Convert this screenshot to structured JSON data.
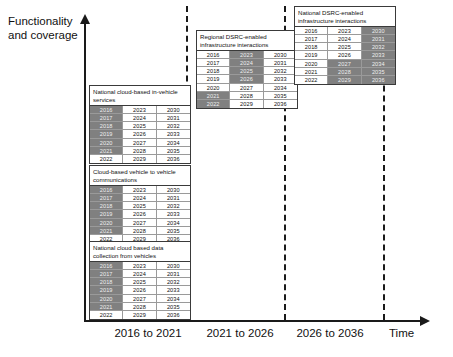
{
  "axes": {
    "y_label": "Functionality and coverage",
    "x_label": "Time",
    "periods": [
      {
        "label": "2016 to 2021",
        "left": 98,
        "width": 100
      },
      {
        "label": "2021 to 2026",
        "left": 190,
        "width": 100
      },
      {
        "label": "2026 to 2036",
        "left": 280,
        "width": 100
      }
    ]
  },
  "colors": {
    "shaded_cell": "#808080",
    "plain_cell": "#ffffff",
    "line": "#1a1a1a",
    "grid": "#9a9a9a"
  },
  "dividers": [
    186,
    284,
    383
  ],
  "chart_data": {
    "type": "table",
    "xlabel": "Time",
    "ylabel": "Functionality and coverage",
    "x_tick_labels": [
      "2016 to 2021",
      "2021 to 2026",
      "2026 to 2036"
    ],
    "legend": [],
    "grid": false,
    "tables": [
      {
        "name": "national-cloud-based-in-vehicle-services",
        "title": "National cloud-based in-vehicle services",
        "left": 89,
        "top": 85,
        "width": 102,
        "columns": [
          [
            "2016",
            "2017",
            "2018",
            "2019",
            "2020",
            "2021",
            "2022"
          ],
          [
            "2023",
            "2024",
            "2025",
            "2026",
            "2027",
            "2028",
            "2029"
          ],
          [
            "2030",
            "2031",
            "2032",
            "2033",
            "2034",
            "2035",
            "2036"
          ]
        ],
        "shaded": [
          [
            true,
            true,
            true,
            true,
            true,
            true,
            false
          ],
          [
            false,
            false,
            false,
            false,
            false,
            false,
            false
          ],
          [
            false,
            false,
            false,
            false,
            false,
            false,
            false
          ]
        ]
      },
      {
        "name": "cloud-based-vehicle-to-vehicle-communications",
        "title": "Cloud-based vehicle to vehicle communications",
        "left": 89,
        "top": 165,
        "width": 102,
        "columns": [
          [
            "2016",
            "2017",
            "2018",
            "2019",
            "2020",
            "2021",
            "2022"
          ],
          [
            "2023",
            "2024",
            "2025",
            "2026",
            "2027",
            "2028",
            "2029"
          ],
          [
            "2030",
            "2031",
            "2032",
            "2033",
            "2034",
            "2035",
            "2036"
          ]
        ],
        "shaded": [
          [
            true,
            true,
            true,
            true,
            true,
            true,
            false
          ],
          [
            false,
            false,
            false,
            false,
            false,
            false,
            false
          ],
          [
            false,
            false,
            false,
            false,
            false,
            false,
            false
          ]
        ]
      },
      {
        "name": "national-cloud-based-data-collection-from-vehicles",
        "title": "National cloud based data collection from vehicles",
        "left": 89,
        "top": 241,
        "width": 102,
        "columns": [
          [
            "2016",
            "2017",
            "2018",
            "2019",
            "2020",
            "2021",
            "2022"
          ],
          [
            "2023",
            "2024",
            "2025",
            "2026",
            "2027",
            "2028",
            "2029"
          ],
          [
            "2030",
            "2031",
            "2032",
            "2033",
            "2034",
            "2035",
            "2036"
          ]
        ],
        "shaded": [
          [
            true,
            true,
            true,
            true,
            true,
            true,
            false
          ],
          [
            false,
            false,
            false,
            false,
            false,
            false,
            false
          ],
          [
            false,
            false,
            false,
            false,
            false,
            false,
            false
          ]
        ]
      },
      {
        "name": "regional-dsrc-enabled-infrastructure-interactions",
        "title": "Regional DSRC-enabled infrastructure interactions",
        "left": 196,
        "top": 30,
        "width": 102,
        "columns": [
          [
            "2016",
            "2017",
            "2018",
            "2019",
            "2020",
            "2021",
            "2022"
          ],
          [
            "2023",
            "2024",
            "2025",
            "2026",
            "2027",
            "2028",
            "2029"
          ],
          [
            "2030",
            "2031",
            "2032",
            "2033",
            "2034",
            "2035",
            "2036"
          ]
        ],
        "shaded": [
          [
            false,
            false,
            false,
            false,
            false,
            true,
            true
          ],
          [
            true,
            true,
            true,
            true,
            false,
            false,
            false
          ],
          [
            false,
            false,
            false,
            false,
            false,
            false,
            false
          ]
        ]
      },
      {
        "name": "national-dsrc-enabled-infrastructure-interactions",
        "title": "National DSRC-enabled infrastructure interactions",
        "left": 294,
        "top": 6,
        "width": 102,
        "columns": [
          [
            "2016",
            "2017",
            "2018",
            "2019",
            "2020",
            "2021",
            "2022"
          ],
          [
            "2023",
            "2024",
            "2025",
            "2026",
            "2027",
            "2028",
            "2029"
          ],
          [
            "2030",
            "2031",
            "2032",
            "2033",
            "2034",
            "2035",
            "2036"
          ]
        ],
        "shaded": [
          [
            false,
            false,
            false,
            false,
            false,
            false,
            false
          ],
          [
            false,
            false,
            false,
            false,
            true,
            true,
            true
          ],
          [
            true,
            true,
            true,
            true,
            true,
            true,
            true
          ]
        ]
      }
    ]
  },
  "caption": ""
}
